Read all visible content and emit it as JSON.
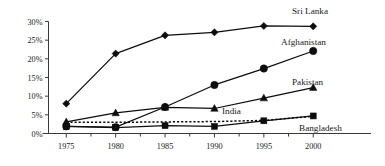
{
  "chart_data": {
    "type": "line",
    "title": "",
    "xlabel": "",
    "ylabel": "",
    "categories": [
      "1975",
      "1980",
      "1985",
      "1990",
      "1995",
      "2000"
    ],
    "x": [
      1975,
      1980,
      1985,
      1990,
      1995,
      2000
    ],
    "xlim": [
      1973.2,
      2001.8
    ],
    "ylim": [
      0,
      30
    ],
    "ytick_values": [
      0,
      5,
      10,
      15,
      20,
      25,
      30
    ],
    "ytick_labels": [
      "0%",
      "5%",
      "10%",
      "15%",
      "20%",
      "25%",
      "30%"
    ],
    "xtick_labels": [
      "1975",
      "1980",
      "1985",
      "1990",
      "1995",
      "2000"
    ],
    "grid": false,
    "legend_position": "inline-right-of-series",
    "series": [
      {
        "name": "Sri Lanka",
        "marker": "diamond",
        "line_style": "solid",
        "values": [
          8.0,
          21.4,
          26.3,
          27.1,
          28.8,
          28.7
        ]
      },
      {
        "name": "Afghanistan",
        "marker": "circle",
        "line_style": "solid",
        "values": [
          1.9,
          1.7,
          7.1,
          13.0,
          17.4,
          22.1
        ]
      },
      {
        "name": "Pakistan",
        "marker": "triangle",
        "line_style": "solid",
        "values": [
          3.1,
          5.5,
          7.0,
          6.7,
          9.5,
          12.3
        ]
      },
      {
        "name": "India",
        "marker": "none",
        "line_style": "dotted",
        "values": [
          3.0,
          3.0,
          3.1,
          3.2,
          3.5,
          4.6
        ]
      },
      {
        "name": "Bangladesh",
        "marker": "square",
        "line_style": "solid",
        "values": [
          1.9,
          1.6,
          2.1,
          1.9,
          3.4,
          4.7
        ]
      }
    ],
    "series_labels": [
      {
        "name": "Sri Lanka",
        "x": 292,
        "y": 14
      },
      {
        "name": "Afghanistan",
        "x": 281,
        "y": 45
      },
      {
        "name": "Pakistan",
        "x": 292,
        "y": 85
      },
      {
        "name": "India",
        "x": 222,
        "y": 114
      },
      {
        "name": "Bangladesh",
        "x": 299,
        "y": 131
      }
    ],
    "colors": {
      "line": "#0d0d0d",
      "axis": "#3a3a3a",
      "text": "#1a1a1a",
      "background": "#ffffff"
    }
  }
}
